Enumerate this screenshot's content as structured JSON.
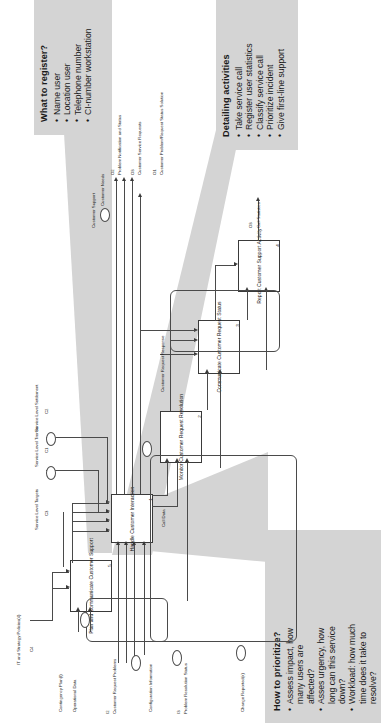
{
  "diagram": {
    "callouts": [
      {
        "id": "what-to-register",
        "title": "What to register?",
        "items": [
          "Name user",
          "Location user",
          "Telephone number",
          "CI-number workstation"
        ]
      },
      {
        "id": "detailing-activities",
        "title": "Detailing activities",
        "items": [
          "Take service call",
          "Register user statistics",
          "Classify service call",
          "Prioritize incident",
          "Give first-line support"
        ]
      },
      {
        "id": "how-to-prioritize",
        "title": "How to prioritize?",
        "items": [
          "Assess impact, how many users are affected?",
          "Asses urgency, how long can this service down?",
          "Workload: how much time does it take to resolve?"
        ]
      }
    ],
    "processes": [
      {
        "num": "1",
        "label": "Handle Customer Interaction"
      },
      {
        "num": "2",
        "label": "Monitor Customer Request Resolution"
      },
      {
        "num": "3",
        "label": "Communicate Customer Request Status"
      },
      {
        "num": "4",
        "label": "Report Customer Support Activity"
      },
      {
        "num": "5",
        "label": "Plan and Communicate Customer Support"
      }
    ],
    "inputs": [
      {
        "code": "I1",
        "label": "Contingency Plan(I)"
      },
      {
        "code": "",
        "label": "Operational Data"
      },
      {
        "code": "I2",
        "label": "Customer Request Problems"
      },
      {
        "code": "",
        "label": "Configuration Information"
      },
      {
        "code": "I3",
        "label": "Problem Resolution Status"
      },
      {
        "code": "",
        "label": "Change Reported(x)"
      }
    ],
    "controls": [
      {
        "code": "C4",
        "label": "IT and Strategy Policies(4)"
      },
      {
        "code": "C3",
        "label": "Service Level Targets"
      },
      {
        "code": "C1",
        "label": "Service Level Trends"
      },
      {
        "code": "C2",
        "label": "Service Level Settlement"
      }
    ],
    "outputs": [
      {
        "code": "",
        "label": "Customer Needs"
      },
      {
        "code": "O2",
        "label": "Problem Notification and Status"
      },
      {
        "code": "O3",
        "label": "Customer Service Requests"
      },
      {
        "code": "O1",
        "label": "Customer Problem/Request Status Solution"
      },
      {
        "code": "O3",
        "label": "Call Statistics"
      }
    ],
    "annotations": [
      {
        "label": "Customer Support"
      },
      {
        "label": "Call Data"
      },
      {
        "label": "Customer Request Response"
      }
    ],
    "colors": {
      "callout_fill": "#d4d4d4",
      "box_stroke": "#3a3a3a",
      "line": "#4a4a4a",
      "page": "#ffffff"
    }
  }
}
